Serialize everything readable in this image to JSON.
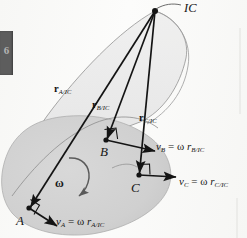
{
  "figure": {
    "background_color": "#fbfbfa",
    "body_fill": "#d3d3d3",
    "cone_fill": "#eaeaea",
    "stroke_color": "#1a1a1a",
    "ic_label": "IC",
    "omega_label": "ω",
    "points": [
      {
        "id": "A",
        "label": "A",
        "x": 29,
        "y": 208
      },
      {
        "id": "B",
        "label": "B",
        "x": 106,
        "y": 140
      },
      {
        "id": "C",
        "label": "C",
        "x": 139,
        "y": 175
      },
      {
        "id": "IC",
        "label": "IC",
        "x": 155,
        "y": 11
      }
    ],
    "position_vectors": [
      {
        "name": "r_A/IC",
        "symbol": "r",
        "subscript": "A/IC",
        "from": "IC",
        "to": "A",
        "label_x": 56,
        "label_y": 86
      },
      {
        "name": "r_B/IC",
        "symbol": "r",
        "subscript": "B/IC",
        "from": "IC",
        "to": "B",
        "label_x": 94,
        "label_y": 101
      },
      {
        "name": "r_C/IC",
        "symbol": "r",
        "subscript": "C/IC",
        "from": "IC",
        "to": "C",
        "label_x": 141,
        "label_y": 115
      }
    ],
    "velocity_equations": [
      {
        "name": "v_A",
        "velocity": "v",
        "v_sub": "A",
        "equals": "=",
        "omega": "ω",
        "r": "r",
        "r_sub": "A/IC",
        "label_x": 57,
        "label_y": 217
      },
      {
        "name": "v_B",
        "velocity": "v",
        "v_sub": "B",
        "equals": "=",
        "omega": "ω",
        "r": "r",
        "r_sub": "B/IC",
        "label_x": 156,
        "label_y": 142
      },
      {
        "name": "v_C",
        "velocity": "v",
        "v_sub": "C",
        "equals": "=",
        "omega": "ω",
        "r": "r",
        "r_sub": "C/IC",
        "label_x": 180,
        "label_y": 177
      }
    ],
    "chapter_tab": {
      "number": "6",
      "color": "#5d5d5d"
    }
  }
}
